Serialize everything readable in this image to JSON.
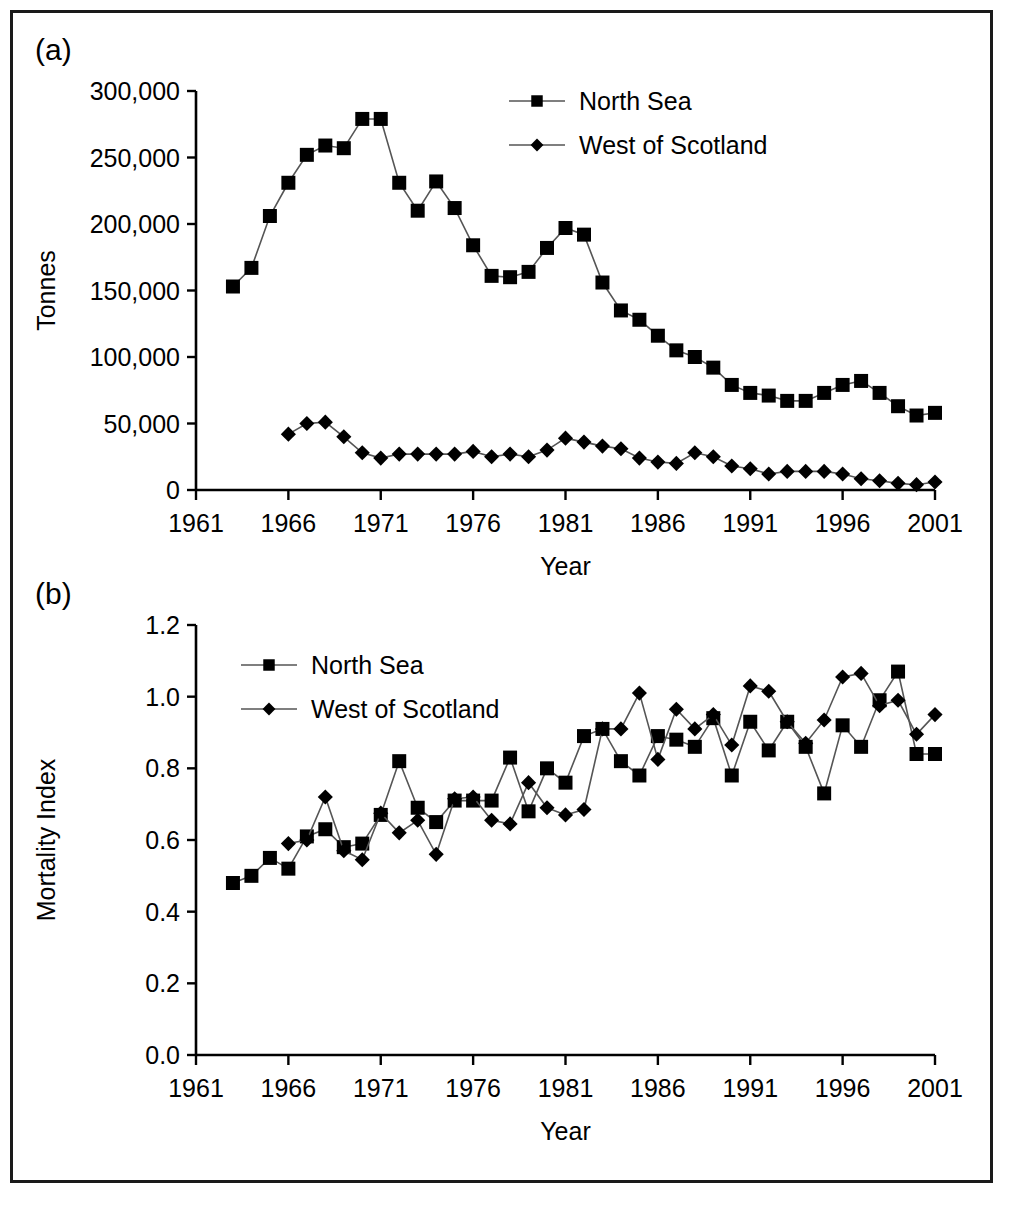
{
  "figure": {
    "panel_a_tag": "(a)",
    "panel_b_tag": "(b)"
  },
  "chart_data": [
    {
      "id": "panel-a",
      "type": "line",
      "title": "",
      "xlabel": "Year",
      "ylabel": "Tonnes",
      "xlim": [
        1961,
        2001
      ],
      "ylim": [
        0,
        300000
      ],
      "xticks": [
        1961,
        1966,
        1971,
        1976,
        1981,
        1986,
        1991,
        1996,
        2001
      ],
      "xticklabels": [
        "1961",
        "1966",
        "1971",
        "1976",
        "1981",
        "1986",
        "1991",
        "1996",
        "2001"
      ],
      "yticks": [
        0,
        50000,
        100000,
        150000,
        200000,
        250000,
        300000
      ],
      "yticklabels": [
        "0",
        "50,000",
        "100,000",
        "150,000",
        "200,000",
        "250,000",
        "300,000"
      ],
      "grid": false,
      "legend_position": "upper-center",
      "series": [
        {
          "name": "North Sea",
          "marker": "square",
          "x": [
            1963,
            1964,
            1965,
            1966,
            1967,
            1968,
            1969,
            1970,
            1971,
            1972,
            1973,
            1974,
            1975,
            1976,
            1977,
            1978,
            1979,
            1980,
            1981,
            1982,
            1983,
            1984,
            1985,
            1986,
            1987,
            1988,
            1989,
            1990,
            1991,
            1992,
            1993,
            1994,
            1995,
            1996,
            1997,
            1998,
            1999,
            2000,
            2001
          ],
          "values": [
            153000,
            167000,
            206000,
            231000,
            252000,
            259000,
            257000,
            279000,
            279000,
            231000,
            210000,
            232000,
            212000,
            184000,
            161000,
            160000,
            164000,
            182000,
            197000,
            192000,
            156000,
            135000,
            128000,
            116000,
            105000,
            100000,
            92000,
            79000,
            73000,
            71000,
            67000,
            67000,
            73000,
            79000,
            82000,
            73000,
            63000,
            56000,
            58000
          ]
        },
        {
          "name": "West of Scotland",
          "marker": "diamond",
          "x": [
            1966,
            1967,
            1968,
            1969,
            1970,
            1971,
            1972,
            1973,
            1974,
            1975,
            1976,
            1977,
            1978,
            1979,
            1980,
            1981,
            1982,
            1983,
            1984,
            1985,
            1986,
            1987,
            1988,
            1989,
            1990,
            1991,
            1992,
            1993,
            1994,
            1995,
            1996,
            1997,
            1998,
            1999,
            2000,
            2001
          ],
          "values": [
            42000,
            50000,
            51000,
            40000,
            28000,
            24000,
            27000,
            27000,
            27000,
            27000,
            29000,
            25000,
            27000,
            25000,
            30000,
            39000,
            36000,
            33000,
            31000,
            24000,
            21000,
            20000,
            28000,
            25000,
            18000,
            16000,
            12000,
            14000,
            14000,
            14000,
            12000,
            8500,
            7000,
            5000,
            4000,
            6000
          ]
        }
      ]
    },
    {
      "id": "panel-b",
      "type": "line",
      "title": "",
      "xlabel": "Year",
      "ylabel": "Mortality Index",
      "xlim": [
        1961,
        2001
      ],
      "ylim": [
        0.0,
        1.2
      ],
      "xticks": [
        1961,
        1966,
        1971,
        1976,
        1981,
        1986,
        1991,
        1996,
        2001
      ],
      "xticklabels": [
        "1961",
        "1966",
        "1971",
        "1976",
        "1981",
        "1986",
        "1991",
        "1996",
        "2001"
      ],
      "yticks": [
        0.0,
        0.2,
        0.4,
        0.6,
        0.8,
        1.0,
        1.2
      ],
      "yticklabels": [
        "0.0",
        "0.2",
        "0.4",
        "0.6",
        "0.8",
        "1.0",
        "1.2"
      ],
      "grid": false,
      "legend_position": "upper-left",
      "series": [
        {
          "name": "North Sea",
          "marker": "square",
          "x": [
            1963,
            1964,
            1965,
            1966,
            1967,
            1968,
            1969,
            1970,
            1971,
            1972,
            1973,
            1974,
            1975,
            1976,
            1977,
            1978,
            1979,
            1980,
            1981,
            1982,
            1983,
            1984,
            1985,
            1986,
            1987,
            1988,
            1989,
            1990,
            1991,
            1992,
            1993,
            1994,
            1995,
            1996,
            1997,
            1998,
            1999,
            2000,
            2001
          ],
          "values": [
            0.48,
            0.5,
            0.55,
            0.52,
            0.61,
            0.63,
            0.58,
            0.59,
            0.67,
            0.82,
            0.69,
            0.65,
            0.71,
            0.71,
            0.71,
            0.83,
            0.68,
            0.8,
            0.76,
            0.89,
            0.91,
            0.82,
            0.78,
            0.89,
            0.88,
            0.86,
            0.94,
            0.78,
            0.93,
            0.85,
            0.93,
            0.86,
            0.73,
            0.92,
            0.86,
            0.99,
            1.07,
            0.84,
            0.84
          ]
        },
        {
          "name": "West of Scotland",
          "marker": "diamond",
          "x": [
            1966,
            1967,
            1968,
            1969,
            1970,
            1971,
            1972,
            1973,
            1974,
            1975,
            1976,
            1977,
            1978,
            1979,
            1980,
            1981,
            1982,
            1983,
            1984,
            1985,
            1986,
            1987,
            1988,
            1989,
            1990,
            1991,
            1992,
            1993,
            1994,
            1995,
            1996,
            1997,
            1998,
            1999,
            2000,
            2001
          ],
          "values": [
            0.59,
            0.6,
            0.72,
            0.57,
            0.545,
            0.675,
            0.62,
            0.655,
            0.56,
            0.715,
            0.72,
            0.655,
            0.645,
            0.76,
            0.69,
            0.67,
            0.685,
            0.91,
            0.91,
            1.01,
            0.825,
            0.965,
            0.91,
            0.95,
            0.865,
            1.03,
            1.015,
            0.93,
            0.87,
            0.935,
            1.055,
            1.065,
            0.975,
            0.99,
            0.895,
            0.95
          ]
        }
      ]
    }
  ]
}
